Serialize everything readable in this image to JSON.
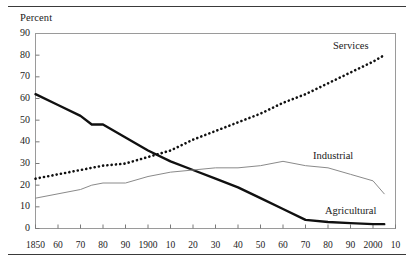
{
  "figure": {
    "axis_title": "Percent",
    "rules": [
      "top-rule",
      "bottom-rule"
    ]
  },
  "chart_data": {
    "type": "line",
    "title": "",
    "subtitle": "",
    "xlabel": "",
    "ylabel": "Percent",
    "xlim": [
      1850,
      2010
    ],
    "ylim": [
      0,
      90
    ],
    "grid": false,
    "legend_position": "inline-right-of-series",
    "yticks": [
      0,
      10,
      20,
      30,
      40,
      50,
      60,
      70,
      80,
      90
    ],
    "ytick_labels": [
      "0",
      "10",
      "20",
      "30",
      "40",
      "50",
      "60",
      "70",
      "80",
      "90"
    ],
    "xticks": [
      1850,
      1860,
      1870,
      1880,
      1890,
      1900,
      1910,
      1920,
      1930,
      1940,
      1950,
      1960,
      1970,
      1980,
      1990,
      2000,
      2010
    ],
    "xtick_labels": [
      "1850",
      "60",
      "70",
      "80",
      "90",
      "1900",
      "10",
      "20",
      "30",
      "40",
      "50",
      "60",
      "70",
      "80",
      "90",
      "2000",
      "10"
    ],
    "x": [
      1850,
      1860,
      1870,
      1875,
      1880,
      1890,
      1900,
      1910,
      1920,
      1930,
      1940,
      1950,
      1960,
      1970,
      1980,
      1990,
      2000,
      2005
    ],
    "series": [
      {
        "name": "Agricultural",
        "style": "thick-solid",
        "color": "#101010",
        "values": [
          62,
          57,
          52,
          48,
          48,
          42,
          36,
          31,
          27,
          23,
          19,
          14,
          9,
          4,
          3,
          2.5,
          2,
          2
        ]
      },
      {
        "name": "Industrial",
        "style": "thin-solid",
        "color": "#8a8a8a",
        "values": [
          14,
          16,
          18,
          20,
          21,
          21,
          24,
          26,
          27,
          28,
          28,
          29,
          31,
          29,
          28,
          25,
          22,
          16
        ]
      },
      {
        "name": "Services",
        "style": "dotted",
        "color": "#101010",
        "values": [
          23,
          25,
          27,
          28,
          29,
          30,
          33,
          36,
          41,
          45,
          49,
          53,
          58,
          62,
          67,
          72,
          77,
          80
        ]
      }
    ],
    "annotations": [
      {
        "text": "Services",
        "x": 1985,
        "y": 82
      },
      {
        "text": "Industrial",
        "x": 1972,
        "y": 33
      },
      {
        "text": "Agricultural",
        "x": 1978,
        "y": 8
      }
    ]
  }
}
